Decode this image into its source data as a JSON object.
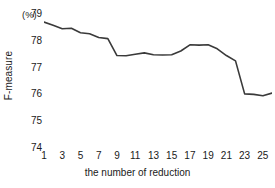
{
  "chart_data": {
    "type": "line",
    "title": "",
    "xlabel": "the number of reduction",
    "ylabel": "F-measure",
    "unit_label": "(%)",
    "xlim": [
      1,
      26
    ],
    "ylim": [
      74,
      79
    ],
    "grid": false,
    "legend": null,
    "line_color": "#3a3a3a",
    "background_color": "#ffffff",
    "text_color": "#1a1a1a",
    "y_ticks": [
      79,
      78,
      77,
      76,
      75,
      74
    ],
    "x_ticks": [
      1,
      3,
      5,
      7,
      9,
      11,
      13,
      15,
      17,
      19,
      21,
      23,
      25
    ],
    "x": [
      1,
      2,
      3,
      4,
      5,
      6,
      7,
      8,
      9,
      10,
      11,
      12,
      13,
      14,
      15,
      16,
      17,
      18,
      19,
      20,
      21,
      22,
      23,
      24,
      25,
      26
    ],
    "values": [
      78.7,
      78.58,
      78.45,
      78.47,
      78.3,
      78.26,
      78.12,
      78.08,
      77.45,
      77.44,
      77.5,
      77.55,
      77.48,
      77.47,
      77.48,
      77.62,
      77.85,
      77.84,
      77.85,
      77.7,
      77.45,
      77.25,
      76.02,
      76.0,
      75.95,
      76.05
    ],
    "series": [
      {
        "name": "F-measure",
        "values": [
          78.7,
          78.58,
          78.45,
          78.47,
          78.3,
          78.26,
          78.12,
          78.08,
          77.45,
          77.44,
          77.5,
          77.55,
          77.48,
          77.47,
          77.48,
          77.62,
          77.85,
          77.84,
          77.85,
          77.7,
          77.45,
          77.25,
          76.02,
          76.0,
          75.95,
          76.05
        ]
      }
    ]
  }
}
